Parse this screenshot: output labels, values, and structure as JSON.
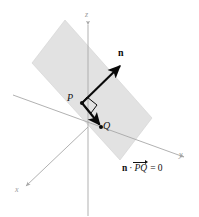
{
  "figure": {
    "background_color": "#ffffff",
    "plane": {
      "name": "shaded-plane",
      "fill_color": "#e2e2e2",
      "stroke_color": "#d2d2d2",
      "corners": [
        [
          65,
          20
        ],
        [
          152,
          118
        ],
        [
          120,
          160
        ],
        [
          32,
          63
        ]
      ]
    },
    "axes": {
      "color": "#a8a8a8",
      "z": {
        "label": "z",
        "label_x": 86,
        "label_y": 16,
        "from": [
          88,
          22
        ],
        "to": [
          88,
          216
        ]
      },
      "y": {
        "label": "y",
        "label_x": 179,
        "label_y": 155,
        "from": [
          13,
          95
        ],
        "to": [
          186,
          158
        ]
      },
      "x": {
        "label": "x",
        "label_x": 16,
        "label_y": 190,
        "from": [
          88,
          127
        ],
        "to": [
          24,
          188
        ]
      }
    },
    "vectors": {
      "normal": {
        "label": "n",
        "label_x": 119,
        "label_y": 52,
        "color": "#0a0a0a",
        "from": [
          82,
          103
        ],
        "to": [
          123,
          63
        ]
      },
      "pq": {
        "color": "#0a0a0a",
        "from": [
          82,
          103
        ],
        "to": [
          101,
          127
        ]
      }
    },
    "points": {
      "p": {
        "label": "P",
        "label_x": 68,
        "label_y": 97,
        "dot_x": 82,
        "dot_y": 103,
        "color": "#0a0a0a"
      },
      "q": {
        "label": "Q",
        "label_x": 103,
        "label_y": 125,
        "dot_x": 101,
        "dot_y": 127,
        "color": "#0a0a0a"
      }
    },
    "right_angle": {
      "name": "right-angle-marker",
      "color": "#0a0a0a",
      "points": [
        [
          87,
          97
        ],
        [
          97,
          105
        ],
        [
          91,
          113
        ],
        [
          82,
          103
        ]
      ]
    },
    "equation": {
      "dot_operator": "·",
      "normal_symbol": "n",
      "segment": "PQ",
      "equals": "= 0",
      "x": 122,
      "y": 167
    }
  }
}
